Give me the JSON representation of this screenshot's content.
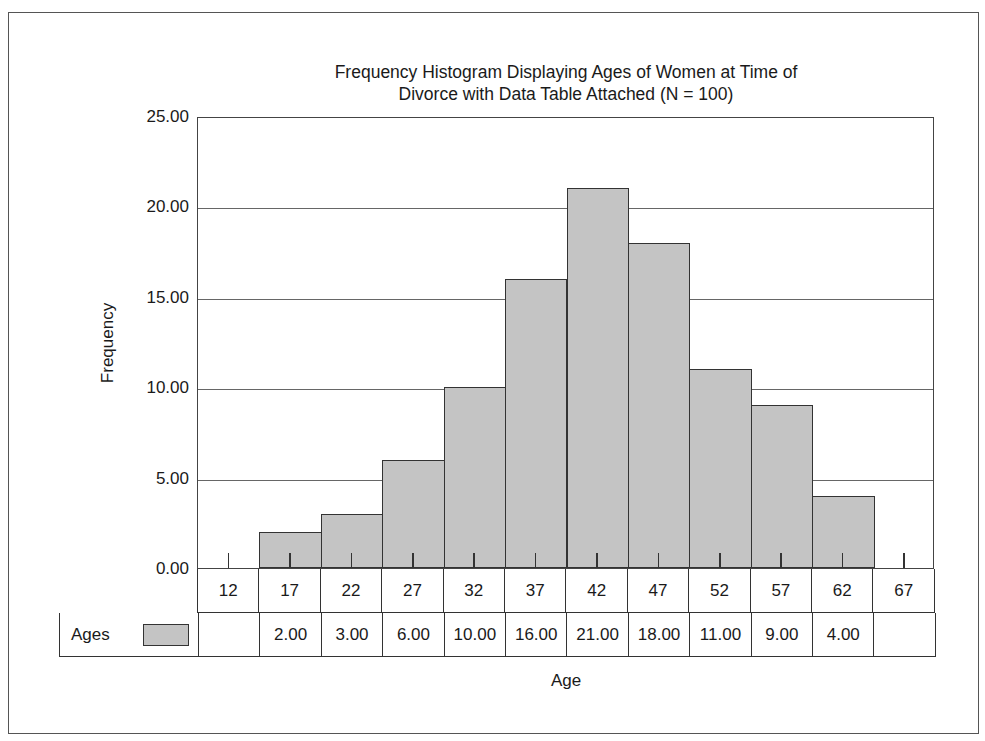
{
  "chart_data": {
    "type": "bar",
    "subtype": "histogram",
    "title": "Frequency Histogram Displaying Ages of Women at Time of Divorce with Data Table Attached (N = 100)",
    "title_lines": [
      "Frequency Histogram Displaying Ages of Women at Time of",
      "Divorce with Data Table Attached (N = 100)"
    ],
    "xlabel": "Age",
    "ylabel": "Frequency",
    "categories": [
      "12",
      "17",
      "22",
      "27",
      "32",
      "37",
      "42",
      "47",
      "52",
      "57",
      "62",
      "67"
    ],
    "series": [
      {
        "name": "Ages",
        "values": [
          0,
          2,
          3,
          6,
          10,
          16,
          21,
          18,
          11,
          9,
          4,
          0
        ],
        "table_values": [
          "",
          "2.00",
          "3.00",
          "6.00",
          "10.00",
          "16.00",
          "21.00",
          "18.00",
          "11.00",
          "9.00",
          "4.00",
          ""
        ],
        "color": "#c4c4c4"
      }
    ],
    "ylim": [
      0,
      25
    ],
    "yticks": [
      "0.00",
      "5.00",
      "10.00",
      "15.00",
      "20.00",
      "25.00"
    ],
    "ytick_values": [
      0,
      5,
      10,
      15,
      20,
      25
    ],
    "grid": true,
    "legend": {
      "position": "data-table",
      "entries": [
        "Ages"
      ]
    },
    "data_table": true
  }
}
